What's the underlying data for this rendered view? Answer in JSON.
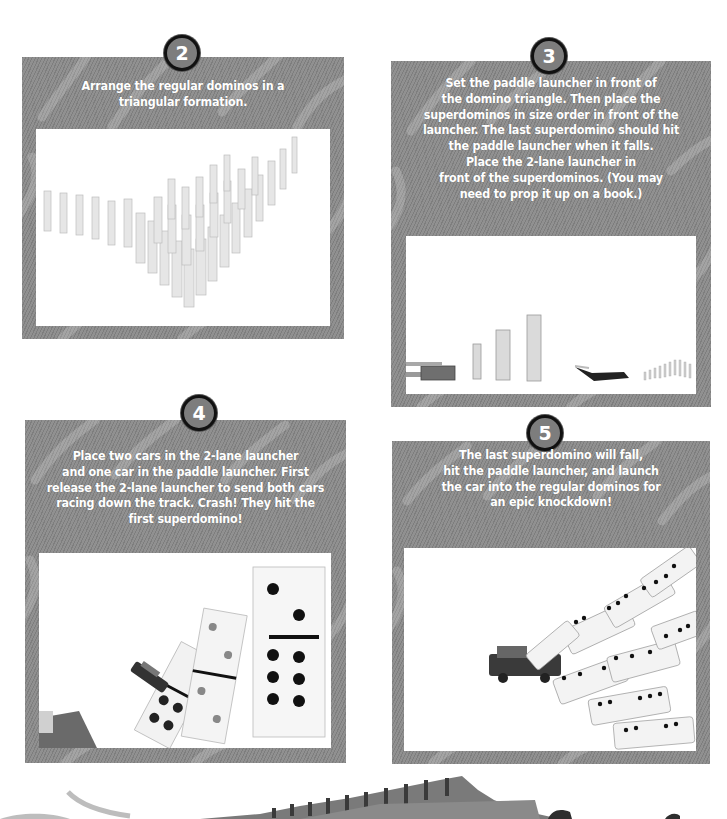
{
  "page": {
    "background": "#ffffff",
    "panel_color": "#8c8c8c",
    "badge_border": "#111111"
  },
  "steps": [
    {
      "number": "2",
      "lines": [
        "Arrange the regular dominos in a",
        "triangular formation."
      ],
      "image": "dominos-triangle-photo"
    },
    {
      "number": "3",
      "lines": [
        "Set the paddle launcher in front of",
        "the domino triangle. Then place the",
        "superdominos in size order in front of the",
        "launcher. The last superdomino should hit",
        "the paddle launcher when it falls.",
        "Place the 2-lane launcher in",
        "front of the superdominos. (You may",
        "need to prop it up on a book.)"
      ],
      "image": "launcher-setup-photo"
    },
    {
      "number": "4",
      "lines": [
        "Place two cars in the 2-lane launcher",
        "and one car in the paddle launcher. First",
        "release the 2-lane launcher to send both cars",
        "racing down the track. Crash! They hit the",
        "first superdomino!"
      ],
      "image": "car-hits-superdomino-photo"
    },
    {
      "number": "5",
      "lines": [
        "The last superdomino will fall,",
        "hit the paddle launcher, and launch",
        "the car into the regular dominos for",
        "an epic knockdown!"
      ],
      "image": "epic-knockdown-photo"
    }
  ]
}
